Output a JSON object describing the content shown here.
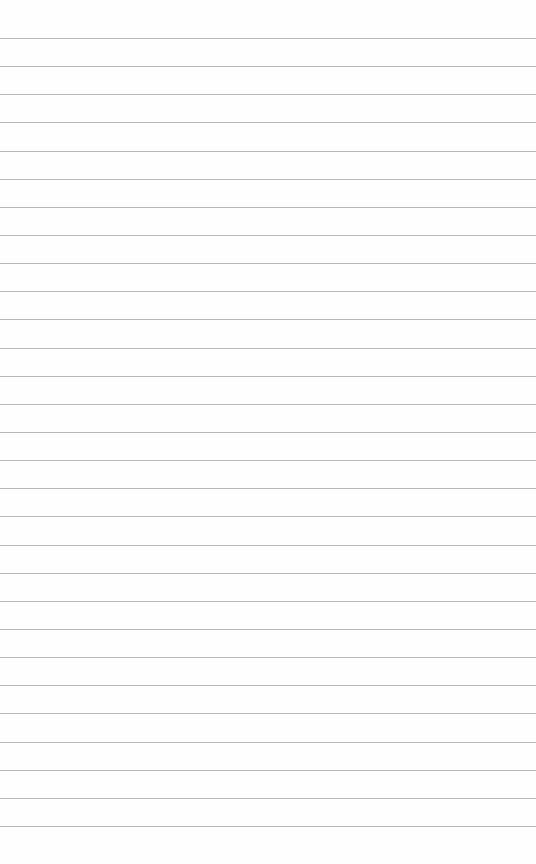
{
  "page": {
    "type": "lined-paper",
    "background_color": "#fefefe",
    "line_color": "#b9b9b9",
    "line_count": 29,
    "first_line_y": 38,
    "line_spacing": 28.14
  }
}
